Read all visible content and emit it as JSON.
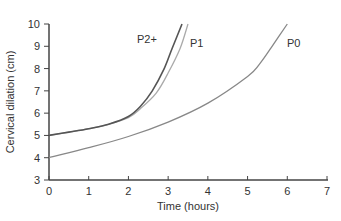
{
  "chart_data": {
    "type": "line",
    "title": "",
    "xlabel": "Time (hours)",
    "ylabel": "Cervical dilation (cm)",
    "xlim": [
      0,
      7
    ],
    "ylim": [
      3,
      10
    ],
    "xticks": [
      0,
      1,
      2,
      3,
      4,
      5,
      6,
      7
    ],
    "yticks": [
      3,
      4,
      5,
      6,
      7,
      8,
      9,
      10
    ],
    "grid": false,
    "legend": "inline labels at curve ends",
    "series": [
      {
        "name": "P2+",
        "color": "#555555",
        "x": [
          0,
          0.5,
          1.0,
          1.5,
          2.0,
          2.3,
          2.6,
          2.9,
          3.1,
          3.35
        ],
        "y": [
          5.0,
          5.15,
          5.3,
          5.5,
          5.85,
          6.3,
          7.0,
          8.0,
          8.9,
          10.0
        ]
      },
      {
        "name": "P1",
        "color": "#aaaaaa",
        "x": [
          0,
          0.5,
          1.0,
          1.5,
          2.0,
          2.3,
          2.7,
          3.0,
          3.3,
          3.5
        ],
        "y": [
          5.0,
          5.15,
          5.3,
          5.5,
          5.8,
          6.2,
          6.9,
          7.8,
          8.9,
          10.0
        ]
      },
      {
        "name": "P0",
        "color": "#888888",
        "x": [
          0,
          1,
          2,
          3,
          4,
          5,
          5.3,
          5.6,
          6.0
        ],
        "y": [
          4.0,
          4.45,
          4.95,
          5.6,
          6.45,
          7.65,
          8.2,
          8.95,
          10.0
        ]
      }
    ]
  }
}
